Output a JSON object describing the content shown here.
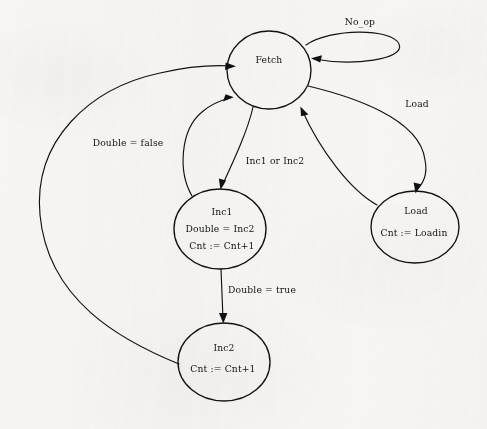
{
  "diagram": {
    "background_color": "#f6f5f3",
    "stroke_color": "#111111",
    "nodes": [
      {
        "id": "fetch",
        "lines": [
          "Fetch"
        ],
        "cx": 269,
        "cy": 70,
        "rx": 42,
        "ry": 39
      },
      {
        "id": "inc1",
        "lines": [
          "Inc1",
          "Double = Inc2",
          "Cnt := Cnt+1"
        ],
        "cx": 220,
        "cy": 229,
        "rx": 46,
        "ry": 40
      },
      {
        "id": "load",
        "lines": [
          "Load",
          "Cnt := Loadin"
        ],
        "cx": 415,
        "cy": 227,
        "rx": 44,
        "ry": 36
      },
      {
        "id": "inc2",
        "lines": [
          "Inc2",
          "Cnt := Cnt+1"
        ],
        "cx": 224,
        "cy": 362,
        "rx": 46,
        "ry": 39
      }
    ],
    "edges": [
      {
        "id": "fetch-self-noop",
        "from": "fetch",
        "to": "fetch",
        "label": "No_op",
        "label_x": 360,
        "label_y": 22
      },
      {
        "id": "fetch-to-load",
        "from": "fetch",
        "to": "load",
        "label": "Load",
        "label_x": 417,
        "label_y": 104
      },
      {
        "id": "load-to-fetch",
        "from": "load",
        "to": "fetch",
        "label": "",
        "label_x": 0,
        "label_y": 0
      },
      {
        "id": "fetch-to-inc1",
        "from": "fetch",
        "to": "inc1",
        "label": "Inc1 or Inc2",
        "label_x": 275,
        "label_y": 161
      },
      {
        "id": "inc1-to-fetch",
        "from": "inc1",
        "to": "fetch",
        "label": "",
        "label_x": 0,
        "label_y": 0
      },
      {
        "id": "inc1-to-inc2",
        "from": "inc1",
        "to": "inc2",
        "label": "Double = true",
        "label_x": 262,
        "label_y": 290
      },
      {
        "id": "inc2-to-fetch",
        "from": "inc2",
        "to": "fetch",
        "label": "Double = false",
        "label_x": 128,
        "label_y": 143
      }
    ]
  }
}
